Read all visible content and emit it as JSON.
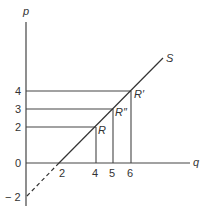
{
  "diagram": {
    "type": "supply-curve",
    "axes": {
      "y_label": "p",
      "x_label": "q",
      "y_ticks": [
        {
          "label": "4",
          "value": 4
        },
        {
          "label": "3",
          "value": 3
        },
        {
          "label": "2",
          "value": 2
        },
        {
          "label": "0",
          "value": 0
        },
        {
          "label": "− 2",
          "value": -2
        }
      ],
      "x_ticks": [
        {
          "label": "2",
          "value": 2
        },
        {
          "label": "4",
          "value": 4
        },
        {
          "label": "5",
          "value": 5
        },
        {
          "label": "6",
          "value": 6
        }
      ]
    },
    "curve": {
      "label": "S",
      "equation": "p = q - 2",
      "solid_segment": "q from 2 to ~7.5",
      "dashed_segment": "q from 0 to 2 (p from -2 to 0)"
    },
    "points": [
      {
        "label": "R",
        "q": 4,
        "p": 2
      },
      {
        "label": "R″",
        "q": 5,
        "p": 3
      },
      {
        "label": "R′",
        "q": 6,
        "p": 4
      }
    ],
    "colors": {
      "line": "#333333",
      "background": "#ffffff"
    }
  }
}
